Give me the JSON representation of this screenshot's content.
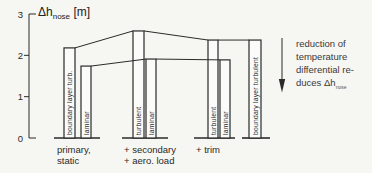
{
  "title": {
    "main": "Δh",
    "sub": "nose",
    "unit": " [m]"
  },
  "chart_data": {
    "type": "bar",
    "ylabel": "Δh_nose [m]",
    "ylim": [
      0,
      3
    ],
    "yticks": [
      0,
      1,
      2,
      3
    ],
    "grid": false,
    "groups": [
      {
        "label_lines": [
          "primary,",
          "static"
        ],
        "bars": [
          {
            "label": "boundary layer turb.",
            "value": 2.18
          },
          {
            "label": "laminar",
            "value": 1.74
          }
        ]
      },
      {
        "label_lines": [
          "+ secondary",
          "+ aero. load"
        ],
        "bars": [
          {
            "label": "turbulent",
            "value": 2.59
          },
          {
            "label": "laminar",
            "value": 1.91
          }
        ]
      },
      {
        "label_lines": [
          "+ trim"
        ],
        "bars": [
          {
            "label": "turbulent",
            "value": 2.37
          },
          {
            "label": "laminar",
            "value": 1.89
          }
        ]
      },
      {
        "label_lines": [],
        "bars": [
          {
            "label": "boundary layer turbulent",
            "value": 2.37
          }
        ]
      }
    ],
    "connectors": [
      [
        0,
        2
      ],
      [
        1,
        3
      ],
      [
        2,
        4
      ],
      [
        3,
        5
      ],
      [
        4,
        6
      ]
    ]
  },
  "annotation": {
    "lines": [
      "reduction of",
      "temperature",
      "differential re-"
    ],
    "last_main": "duces Δh",
    "last_sub": "nose",
    "arrow": "down"
  },
  "colors": {
    "ink": "#2a2a28",
    "paper": "#f6f6f3",
    "bar_fill": "#fbfbf9"
  }
}
